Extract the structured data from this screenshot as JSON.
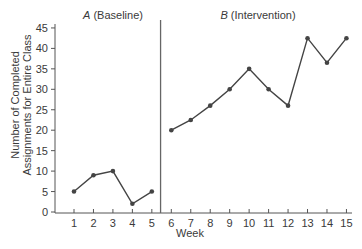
{
  "chart_data": {
    "type": "line",
    "title": "",
    "xlabel": "Week",
    "ylabel": [
      "Number of Completed",
      "Assignments for Entire Class"
    ],
    "x": [
      1,
      2,
      3,
      4,
      5,
      6,
      7,
      8,
      9,
      10,
      11,
      12,
      13,
      14,
      15
    ],
    "xlim": [
      0,
      15.5
    ],
    "ylim": [
      0,
      47
    ],
    "yticks": [
      0,
      5,
      10,
      15,
      20,
      25,
      30,
      35,
      40,
      45
    ],
    "xticks": [
      1,
      2,
      3,
      4,
      5,
      6,
      7,
      8,
      9,
      10,
      11,
      12,
      13,
      14,
      15
    ],
    "grid": false,
    "phase_divider_x": 5.5,
    "phases": [
      {
        "letter": "A",
        "name": "(Baseline)"
      },
      {
        "letter": "B",
        "name": "(Intervention)"
      }
    ],
    "series": [
      {
        "name": "A (Baseline)",
        "x": [
          1,
          2,
          3,
          4,
          5
        ],
        "values": [
          5,
          9,
          10,
          2,
          5
        ]
      },
      {
        "name": "B (Intervention)",
        "x": [
          6,
          7,
          8,
          9,
          10,
          11,
          12,
          13,
          14,
          15
        ],
        "values": [
          20,
          22.5,
          26,
          30,
          35,
          30,
          26,
          42.5,
          36.5,
          42.5
        ]
      }
    ],
    "colors": {
      "line": "#444444",
      "marker": "#444444",
      "axis": "#555555",
      "text": "#3a3a3a"
    }
  }
}
